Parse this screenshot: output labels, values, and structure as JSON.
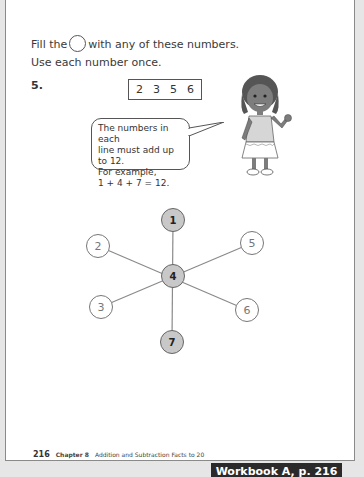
{
  "instructions": {
    "line1_before": "Fill the",
    "line1_after": "with any of these numbers.",
    "line2": "Use each number once."
  },
  "question": {
    "number": "5.",
    "choices": [
      "2",
      "3",
      "5",
      "6"
    ],
    "speech_bubble": {
      "line1": "The numbers in each",
      "line2": "line must add up to 12.",
      "line3": "For example,",
      "line4": "1 + 4 + 7 = 12."
    }
  },
  "diagram": {
    "nodes": [
      {
        "id": "top",
        "value": "1",
        "filled": true
      },
      {
        "id": "upper-left",
        "value": "2",
        "filled": false
      },
      {
        "id": "upper-right",
        "value": "5",
        "filled": false
      },
      {
        "id": "center",
        "value": "4",
        "filled": true
      },
      {
        "id": "lower-left",
        "value": "3",
        "filled": false
      },
      {
        "id": "lower-right",
        "value": "6",
        "filled": false
      },
      {
        "id": "bottom",
        "value": "7",
        "filled": true
      }
    ],
    "filled_color": "#c8c8c8"
  },
  "footer": {
    "page_number": "216",
    "chapter": "Chapter 8",
    "chapter_title": "Addition and Subtraction Facts to 20"
  },
  "caption": "Workbook A, p. 216"
}
